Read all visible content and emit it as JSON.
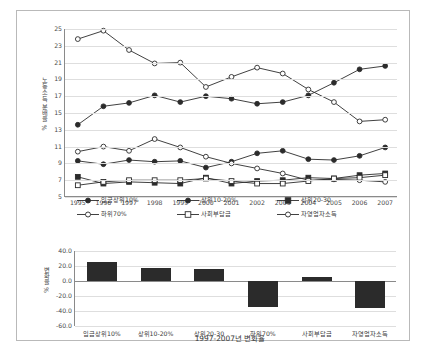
{
  "chart_data": [
    {
      "type": "line",
      "title": "",
      "xlabel": "",
      "ylabel": "노동소득 분배율 %",
      "ylim": [
        5,
        25
      ],
      "ytick_step": 2,
      "yticks": [
        "5",
        "7",
        "9",
        "11",
        "13",
        "15",
        "17",
        "19",
        "21",
        "23",
        "25"
      ],
      "grid": true,
      "legend_position": "bottom",
      "x": [
        "1995",
        "1996",
        "1997",
        "1998",
        "1999",
        "2000",
        "2001",
        "2002",
        "2003",
        "2004",
        "2005",
        "2006",
        "2007"
      ],
      "series": [
        {
          "name": "임금상위10%",
          "marker": "filled-circle",
          "values": [
            13.6,
            15.8,
            16.2,
            17.1,
            16.3,
            17.0,
            16.7,
            16.1,
            16.3,
            17.1,
            18.6,
            20.2,
            20.6
          ]
        },
        {
          "name": "상위10-20%",
          "marker": "filled-circle",
          "values": [
            9.3,
            8.9,
            9.4,
            9.2,
            9.3,
            8.5,
            9.2,
            10.2,
            10.5,
            9.5,
            9.4,
            9.9,
            10.9
          ]
        },
        {
          "name": "상위20-30",
          "marker": "filled-square",
          "values": [
            7.4,
            6.6,
            6.8,
            6.7,
            6.6,
            7.3,
            6.6,
            6.9,
            7.0,
            7.3,
            7.2,
            7.6,
            7.8
          ]
        },
        {
          "name": "하위70%",
          "marker": "open-circle",
          "values": [
            10.4,
            11.0,
            10.5,
            11.9,
            10.9,
            9.8,
            9.0,
            8.4,
            7.8,
            7.0,
            7.1,
            7.0,
            6.8
          ]
        },
        {
          "name": "사회부담금",
          "marker": "open-square",
          "values": [
            6.4,
            6.8,
            7.0,
            7.0,
            7.0,
            7.2,
            6.9,
            6.6,
            6.6,
            6.9,
            7.2,
            7.3,
            7.6
          ]
        },
        {
          "name": "자영업자소득",
          "marker": "open-circle",
          "values": [
            23.8,
            24.8,
            22.5,
            20.9,
            21.0,
            18.1,
            19.3,
            20.4,
            19.7,
            17.8,
            16.3,
            14.0,
            14.2
          ]
        }
      ]
    },
    {
      "type": "bar",
      "title": "1997-2007년 변화율",
      "xlabel": "1997-2007년 변화율",
      "ylabel": "변화율 %",
      "ylim": [
        -60,
        40
      ],
      "ytick_step": 20,
      "yticks": [
        "40.0",
        "20.0",
        "0.0",
        "-20.0",
        "-40.0",
        "-60.0"
      ],
      "grid": true,
      "categories": [
        "임금상위10%",
        "상위10-20%",
        "상위20-30",
        "하위70%",
        "사회부담금",
        "자영업자소득"
      ],
      "values": [
        26.0,
        18.0,
        16.0,
        -35.0,
        6.0,
        -36.0
      ]
    }
  ],
  "top_chart": {
    "ylabel": "노동소득 분배율 %",
    "yticks": [
      "25",
      "23",
      "21",
      "19",
      "17",
      "15",
      "13",
      "11",
      "9",
      "7",
      "5"
    ],
    "xticks": [
      "1995",
      "1996",
      "1997",
      "1998",
      "1999",
      "2000",
      "2001",
      "2002",
      "2003",
      "2004",
      "2005",
      "2006",
      "2007"
    ]
  },
  "legend": {
    "row1": [
      {
        "label": "임금상위10%",
        "marker": "filled-circle"
      },
      {
        "label": "상위10-20%",
        "marker": "filled-circle"
      },
      {
        "label": "상위20-30",
        "marker": "filled-square"
      }
    ],
    "row2": [
      {
        "label": "하위70%",
        "marker": "open-circle"
      },
      {
        "label": "사회부담금",
        "marker": "open-square"
      },
      {
        "label": "자영업자소득",
        "marker": "open-circle"
      }
    ]
  },
  "bottom_chart": {
    "ylabel": "변화율 %",
    "yticks": [
      "40.0",
      "20.0",
      "0.0",
      "-20.0",
      "-40.0",
      "-60.0"
    ],
    "categories": [
      "임금상위10%",
      "상위10-20%",
      "상위20-30",
      "하위70%",
      "사회부담금",
      "자영업자소득"
    ],
    "title": "1997-2007년 변화율"
  },
  "colors": {
    "line": "#2b2b2b",
    "bar": "#2b2b2b",
    "grid": "#dedede",
    "axis": "#8a8a8a",
    "frame": "#b9b9b9"
  }
}
